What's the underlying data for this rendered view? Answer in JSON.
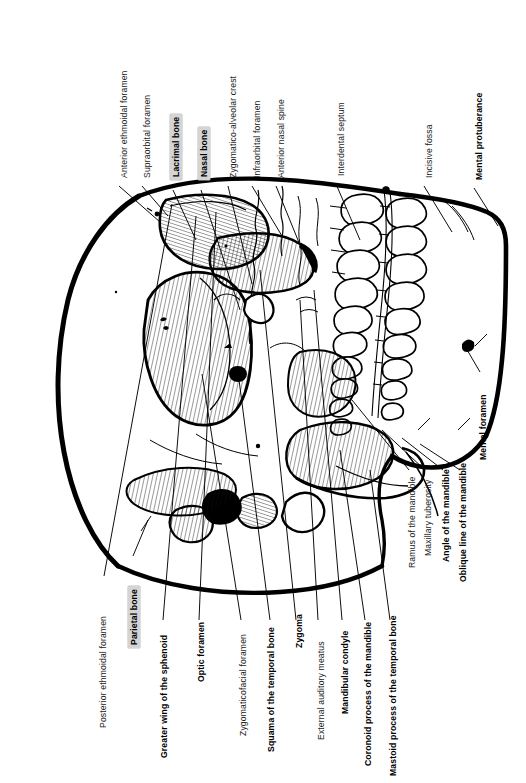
{
  "figure": {
    "orientation": "rotated-90",
    "background_color": "#ffffff",
    "line_color": "#000000",
    "highlight_color": "#d4d4d4"
  },
  "labels_top": [
    {
      "id": "anterior-ethmoidal-foramen",
      "text": "Anterior ethmoidal foramen",
      "style": "plain"
    },
    {
      "id": "supraorbital-foramen",
      "text": "Supraorbital foramen",
      "style": "plain"
    },
    {
      "id": "lacrimal-bone",
      "text": "Lacrimal bone",
      "style": "bold-highlight"
    },
    {
      "id": "nasal-bone",
      "text": "Nasal bone",
      "style": "bold-highlight"
    },
    {
      "id": "zygomatico-alveolar-crest",
      "text": "Zygomatico-alveolar crest",
      "style": "plain"
    },
    {
      "id": "infraorbital-foramen",
      "text": "Infraorbital foramen",
      "style": "plain"
    },
    {
      "id": "anterior-nasal-spine",
      "text": "Anterior nasal spine",
      "style": "plain"
    },
    {
      "id": "interdental-septum",
      "text": "Interdental septum",
      "style": "plain"
    },
    {
      "id": "incisive-fossa",
      "text": "Incisive fossa",
      "style": "plain"
    },
    {
      "id": "mental-protuberance",
      "text": "Mental protuberance",
      "style": "bold"
    }
  ],
  "labels_bottom": [
    {
      "id": "posterior-ethmoidal-foramen",
      "text": "Posterior ethmoidal foramen",
      "style": "plain"
    },
    {
      "id": "parietal-bone",
      "text": "Parietal bone",
      "style": "bold-highlight"
    },
    {
      "id": "greater-wing-of-the-sphenoid",
      "text": "Greater wing of the sphenoid",
      "style": "bold"
    },
    {
      "id": "optic-foramen",
      "text": "Optic foramen",
      "style": "bold"
    },
    {
      "id": "zygomaticofacial-foramen",
      "text": "Zygomaticofacial foramen",
      "style": "plain"
    },
    {
      "id": "squama-of-the-temporal-bone",
      "text": "Squama of the temporal bone",
      "style": "bold"
    },
    {
      "id": "zygoma",
      "text": "Zygoma",
      "style": "bold"
    },
    {
      "id": "external-auditory-meatus",
      "text": "External auditory meatus",
      "style": "plain"
    },
    {
      "id": "mandibular-condyle",
      "text": "Mandibular condyle",
      "style": "bold"
    },
    {
      "id": "coronoid-process-of-the-mandible",
      "text": "Coronoid process of the mandible",
      "style": "bold"
    },
    {
      "id": "mastoid-process-of-the-temporal-bone",
      "text": "Mastoid process of the temporal bone",
      "style": "bold"
    }
  ],
  "labels_right": [
    {
      "id": "ramus-of-the-mandible",
      "text": "Ramus of the mandible",
      "style": "plain"
    },
    {
      "id": "maxillary-tuberosity",
      "text": "Maxillary tuberosity",
      "style": "plain"
    },
    {
      "id": "angle-of-the-mandible",
      "text": "Angle of the mandible",
      "style": "bold"
    },
    {
      "id": "oblique-line-of-the-mandible",
      "text": "Oblique line of the mandible",
      "style": "bold"
    },
    {
      "id": "mental-foramen",
      "text": "Mental foramen",
      "style": "bold"
    }
  ]
}
